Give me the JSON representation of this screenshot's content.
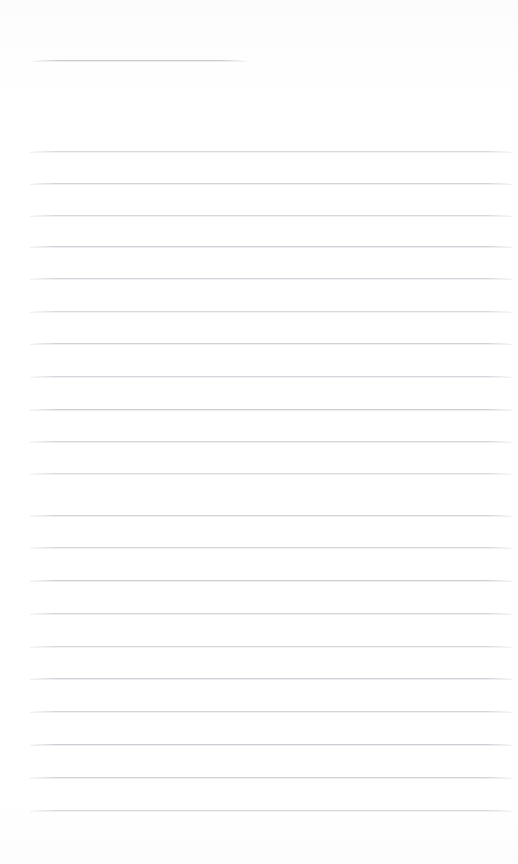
{
  "document": {
    "kind": "scanned-blank-ruled-page",
    "title_text": "",
    "body_text": "",
    "page_width": 518,
    "page_height": 864,
    "background_color": "#ffffff",
    "rule_color": "#c9ccd1",
    "rule_color_light": "#eceef0",
    "rule_thickness": 1
  },
  "header_rule": {
    "name": "title-rule",
    "x": 33,
    "y": 60,
    "width": 213,
    "label": ""
  },
  "body_rules": [
    {
      "y": 151,
      "x": 30,
      "width": 482,
      "label": ""
    },
    {
      "y": 183,
      "x": 30,
      "width": 482,
      "label": ""
    },
    {
      "y": 215,
      "x": 30,
      "width": 482,
      "label": ""
    },
    {
      "y": 246,
      "x": 30,
      "width": 482,
      "label": ""
    },
    {
      "y": 278,
      "x": 30,
      "width": 482,
      "label": ""
    },
    {
      "y": 311,
      "x": 30,
      "width": 482,
      "label": ""
    },
    {
      "y": 343,
      "x": 30,
      "width": 482,
      "label": ""
    },
    {
      "y": 376,
      "x": 30,
      "width": 482,
      "label": ""
    },
    {
      "y": 409,
      "x": 30,
      "width": 482,
      "label": ""
    },
    {
      "y": 441,
      "x": 30,
      "width": 482,
      "label": ""
    },
    {
      "y": 473,
      "x": 30,
      "width": 482,
      "label": ""
    },
    {
      "y": 515,
      "x": 30,
      "width": 482,
      "label": ""
    },
    {
      "y": 547,
      "x": 30,
      "width": 482,
      "label": ""
    },
    {
      "y": 580,
      "x": 30,
      "width": 482,
      "label": ""
    },
    {
      "y": 613,
      "x": 30,
      "width": 482,
      "label": ""
    },
    {
      "y": 646,
      "x": 30,
      "width": 482,
      "label": ""
    },
    {
      "y": 678,
      "x": 30,
      "width": 482,
      "label": ""
    },
    {
      "y": 711,
      "x": 30,
      "width": 482,
      "label": ""
    },
    {
      "y": 744,
      "x": 30,
      "width": 482,
      "label": ""
    },
    {
      "y": 777,
      "x": 30,
      "width": 482,
      "label": ""
    },
    {
      "y": 810,
      "x": 30,
      "width": 482,
      "label": ""
    }
  ]
}
